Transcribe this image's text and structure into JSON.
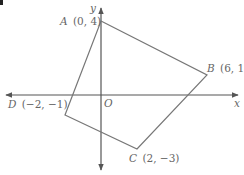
{
  "diagram": {
    "axes": {
      "x_label": "x",
      "y_label": "y",
      "origin_label": "O"
    },
    "points": [
      {
        "name": "A",
        "coords": "(0, 4)",
        "x": 0,
        "y": 4
      },
      {
        "name": "B",
        "coords": "(6, 1)",
        "x": 6,
        "y": 1
      },
      {
        "name": "C",
        "coords": "(2, −3)",
        "x": 2,
        "y": -3
      },
      {
        "name": "D",
        "coords": "(−2, −1)",
        "x": -2,
        "y": -1
      }
    ],
    "colors": {
      "lines": "#777777",
      "axes": "#555555",
      "text": "#666666"
    }
  }
}
